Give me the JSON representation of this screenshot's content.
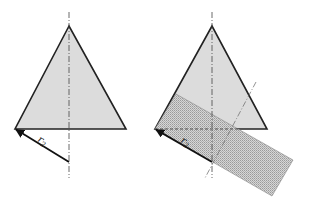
{
  "figures": [
    {
      "id": "left",
      "triangle": {
        "apex": [
          69,
          26
        ],
        "base_left": [
          15,
          129
        ],
        "base_right": [
          126,
          129
        ],
        "fill": "#dcdcdc",
        "stroke": "#222222"
      },
      "axis": {
        "x": 69,
        "y1": 12,
        "y2": 178,
        "style": "dash-dot"
      },
      "radius_vector": {
        "from": [
          69,
          162
        ],
        "to": [
          15,
          129
        ],
        "label": "r",
        "subscript": "2"
      }
    },
    {
      "id": "right",
      "triangle": {
        "apex": [
          212,
          26
        ],
        "base_left": [
          155,
          129
        ],
        "base_right": [
          267,
          129
        ],
        "fill": "#dcdcdc",
        "stroke": "#222222"
      },
      "axis": {
        "x": 212,
        "y1": 12,
        "y2": 178,
        "style": "dash-dot"
      },
      "rotated_axis": {
        "from": [
          256,
          82
        ],
        "to": [
          205,
          178
        ],
        "style": "dash-dot"
      },
      "horizontal_dashed": {
        "from": [
          155,
          129
        ],
        "to": [
          240,
          129
        ]
      },
      "rectangle": {
        "points": [
          [
            155,
            129
          ],
          [
            176,
            94
          ],
          [
            293,
            160
          ],
          [
            272,
            196
          ]
        ],
        "fill": "#c8c8c8",
        "pattern": "stipple"
      },
      "radius_vector": {
        "from": [
          212,
          162
        ],
        "to": [
          155,
          129
        ],
        "label": "r",
        "subscript": "2"
      }
    }
  ]
}
